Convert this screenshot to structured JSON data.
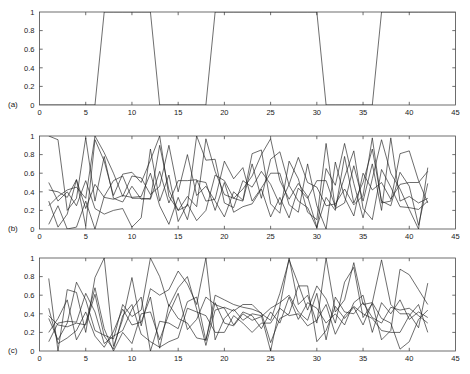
{
  "figure": {
    "background_color": "#ffffff",
    "line_color": "#1f1f1f",
    "axis_color": "#4a4a4a",
    "panel_tags": [
      "(a)",
      "(b)",
      "(c)"
    ]
  },
  "chart_data": [
    {
      "type": "line",
      "title": "",
      "panel_tag": "(a)",
      "xlabel": "",
      "ylabel": "",
      "xlim": [
        0,
        45
      ],
      "ylim": [
        0,
        1
      ],
      "xticks": [
        0,
        5,
        10,
        15,
        20,
        25,
        30,
        35,
        40,
        45
      ],
      "xticklabels": [
        "0",
        "5",
        "10",
        "15",
        "20",
        "25",
        "30",
        "35",
        "40",
        "45"
      ],
      "yticks": [
        0,
        0.2,
        0.4,
        0.6,
        0.8,
        1
      ],
      "yticklabels": [
        "0",
        "0.2",
        "0.4",
        "0.6",
        "0.8",
        "1"
      ],
      "grid": false,
      "legend": "none",
      "series": [
        {
          "name": "binary-regime-signal",
          "x": [
            0,
            1,
            2,
            3,
            4,
            5,
            6,
            7,
            8,
            9,
            10,
            11,
            12,
            13,
            14,
            15,
            16,
            17,
            18,
            19,
            20,
            21,
            22,
            23,
            24,
            25,
            26,
            27,
            28,
            29,
            30,
            31,
            32,
            33,
            34,
            35,
            36,
            37,
            38,
            39,
            40,
            41,
            42,
            43,
            44,
            45
          ],
          "values": [
            0,
            0,
            0,
            0,
            0,
            0,
            0,
            1,
            1,
            1,
            1,
            1,
            1,
            0,
            0,
            0,
            0,
            0,
            0,
            1,
            1,
            1,
            1,
            1,
            1,
            1,
            1,
            1,
            1,
            1,
            1,
            0,
            0,
            0,
            0,
            0,
            0,
            1,
            1,
            1,
            1,
            1,
            1,
            1,
            1,
            1
          ]
        }
      ]
    },
    {
      "type": "line",
      "title": "",
      "panel_tag": "(b)",
      "xlabel": "",
      "ylabel": "",
      "xlim": [
        0,
        45
      ],
      "ylim": [
        0,
        1
      ],
      "xticks": [
        0,
        5,
        10,
        15,
        20,
        25,
        30,
        35,
        40,
        45
      ],
      "xticklabels": [
        "0",
        "5",
        "10",
        "15",
        "20",
        "25",
        "30",
        "35",
        "40",
        "45"
      ],
      "yticks": [
        0,
        0.2,
        0.4,
        0.6,
        0.8,
        1
      ],
      "yticklabels": [
        "0",
        "0.2",
        "0.4",
        "0.6",
        "0.8",
        "1"
      ],
      "grid": false,
      "legend": "none",
      "x": [
        1,
        2,
        3,
        4,
        5,
        6,
        7,
        8,
        9,
        10,
        11,
        12,
        13,
        14,
        15,
        16,
        17,
        18,
        19,
        20,
        21,
        22,
        23,
        24,
        25,
        26,
        27,
        28,
        29,
        30,
        31,
        32,
        33,
        34,
        35,
        36,
        37,
        38,
        39,
        40,
        41,
        42
      ],
      "series": [
        {
          "name": "series-1",
          "values": [
            1.0,
            0.96,
            0.2,
            0.33,
            0.98,
            0.3,
            0.78,
            0.33,
            0.29,
            0.46,
            0.32,
            0.33,
            0.9,
            0.42,
            0.2,
            0.35,
            0.24,
            0.97,
            0.62,
            0.37,
            0.33,
            0.43,
            0.57,
            0.8,
            0.97,
            0.52,
            0.32,
            0.49,
            0.35,
            0.02,
            0.34,
            0.2,
            0.78,
            0.28,
            0.5,
            0.86,
            0.3,
            0.25,
            0.61,
            0.46,
            0.04,
            0.49
          ]
        },
        {
          "name": "series-2",
          "values": [
            0.3,
            0.02,
            0.16,
            0.53,
            0.03,
            0.96,
            0.73,
            0.36,
            0.59,
            0.61,
            0.5,
            0.74,
            1.0,
            0.35,
            0.2,
            0.25,
            1.0,
            0.74,
            0.75,
            0.28,
            0.23,
            0.52,
            0.45,
            0.62,
            0.48,
            0.26,
            0.48,
            0.77,
            0.5,
            0.45,
            0.25,
            0.27,
            0.43,
            0.26,
            0.36,
            0.98,
            0.28,
            0.3,
            0.81,
            0.84,
            0.52,
            0.28
          ]
        },
        {
          "name": "series-3",
          "values": [
            0.5,
            0.3,
            0.4,
            0.25,
            0.52,
            0.22,
            0.16,
            0.2,
            0.22,
            0.02,
            0.12,
            0.86,
            0.3,
            0.58,
            0.08,
            0.27,
            0.09,
            0.2,
            0.58,
            0.52,
            0.33,
            0.3,
            0.7,
            0.33,
            0.75,
            0.83,
            0.47,
            0.3,
            0.23,
            0.01,
            0.65,
            0.47,
            0.92,
            0.49,
            0.12,
            0.54,
            0.96,
            0.6,
            0.43,
            0.21,
            0.0,
            0.66
          ]
        },
        {
          "name": "series-4",
          "values": [
            0.25,
            0.35,
            0.42,
            0.45,
            0.33,
            1.0,
            0.82,
            0.6,
            0.35,
            0.57,
            0.55,
            0.37,
            0.46,
            0.9,
            0.4,
            0.8,
            0.36,
            0.46,
            0.3,
            0.13,
            0.4,
            0.31,
            0.81,
            0.85,
            0.27,
            0.17,
            0.73,
            0.54,
            0.18,
            0.1,
            0.92,
            0.22,
            0.28,
            0.68,
            0.3,
            0.7,
            0.2,
            0.98,
            0.3,
            0.35,
            0.28,
            0.33
          ]
        },
        {
          "name": "series-5",
          "values": [
            0.05,
            0.25,
            0.0,
            0.02,
            0.3,
            0.0,
            0.35,
            0.52,
            0.57,
            0.33,
            0.33,
            0.32,
            0.62,
            0.28,
            0.52,
            0.52,
            0.53,
            0.3,
            0.32,
            0.73,
            0.54,
            0.66,
            0.3,
            0.44,
            0.6,
            0.6,
            0.26,
            0.18,
            0.7,
            0.25,
            0.0,
            0.72,
            0.34,
            0.14,
            0.6,
            0.42,
            0.5,
            0.32,
            0.48,
            0.5,
            0.5,
            0.62
          ]
        },
        {
          "name": "series-6",
          "values": [
            0.42,
            0.4,
            0.34,
            0.53,
            0.22,
            0.48,
            0.34,
            0.32,
            0.36,
            0.34,
            0.35,
            0.6,
            0.25,
            0.05,
            0.34,
            0.1,
            0.52,
            0.5,
            0.2,
            0.5,
            0.18,
            0.24,
            0.27,
            0.43,
            0.13,
            0.34,
            0.12,
            0.44,
            0.33,
            0.52,
            0.52,
            0.24,
            0.56,
            0.84,
            0.22,
            0.1,
            0.64,
            0.45,
            0.24,
            0.23,
            0.21,
            0.3
          ]
        }
      ]
    },
    {
      "type": "line",
      "title": "",
      "panel_tag": "(c)",
      "xlabel": "",
      "ylabel": "",
      "xlim": [
        0,
        45
      ],
      "ylim": [
        0,
        1
      ],
      "xticks": [
        0,
        5,
        10,
        15,
        20,
        25,
        30,
        35,
        40,
        45
      ],
      "xticklabels": [
        "0",
        "5",
        "10",
        "15",
        "20",
        "25",
        "30",
        "35",
        "40",
        "45"
      ],
      "yticks": [
        0,
        0.2,
        0.4,
        0.6,
        0.8,
        1
      ],
      "yticklabels": [
        "0",
        "0.2",
        "0.4",
        "0.6",
        "0.8",
        "1"
      ],
      "grid": false,
      "legend": "none",
      "x": [
        1,
        2,
        3,
        4,
        5,
        6,
        7,
        8,
        9,
        10,
        11,
        12,
        13,
        14,
        15,
        16,
        17,
        18,
        19,
        20,
        21,
        22,
        23,
        24,
        25,
        26,
        27,
        28,
        29,
        30,
        31,
        32,
        33,
        34,
        35,
        36,
        37,
        38,
        39,
        40,
        41,
        42
      ],
      "series": [
        {
          "name": "series-1",
          "values": [
            0.78,
            0.0,
            0.66,
            0.63,
            0.2,
            0.79,
            1.0,
            0.05,
            0.34,
            0.79,
            0.27,
            0.67,
            0.6,
            0.66,
            0.86,
            0.72,
            0.5,
            1.0,
            0.12,
            0.35,
            0.45,
            0.33,
            0.4,
            0.38,
            0.0,
            0.48,
            1.0,
            0.5,
            0.6,
            0.3,
            1.0,
            0.42,
            0.55,
            0.95,
            0.5,
            0.52,
            0.98,
            0.5,
            0.4,
            0.4,
            0.25,
            0.73
          ]
        },
        {
          "name": "series-2",
          "values": [
            0.35,
            0.12,
            0.3,
            0.74,
            0.55,
            0.22,
            0.17,
            0.13,
            0.5,
            0.37,
            0.44,
            1.0,
            0.8,
            0.48,
            0.68,
            0.8,
            0.45,
            0.06,
            0.44,
            0.47,
            0.43,
            0.5,
            0.5,
            0.4,
            0.33,
            0.62,
            0.98,
            0.72,
            0.44,
            0.7,
            0.56,
            0.3,
            0.74,
            0.9,
            0.36,
            0.51,
            0.12,
            0.22,
            0.88,
            0.82,
            0.66,
            0.5
          ]
        },
        {
          "name": "series-3",
          "values": [
            0.1,
            0.3,
            0.32,
            0.31,
            0.62,
            0.42,
            0.08,
            0.16,
            0.22,
            0.45,
            0.58,
            0.0,
            0.32,
            0.3,
            0.24,
            0.53,
            0.58,
            0.11,
            0.6,
            0.55,
            0.5,
            0.47,
            0.45,
            0.41,
            0.09,
            0.35,
            0.4,
            0.7,
            0.7,
            0.1,
            0.22,
            0.48,
            0.35,
            0.47,
            0.28,
            0.52,
            0.35,
            0.3,
            0.02,
            0.1,
            0.34,
            0.44
          ]
        },
        {
          "name": "series-4",
          "values": [
            0.38,
            0.28,
            0.26,
            0.3,
            0.28,
            0.61,
            0.16,
            0.02,
            0.38,
            0.5,
            0.18,
            0.1,
            0.04,
            0.1,
            0.14,
            0.46,
            0.42,
            0.38,
            0.2,
            0.2,
            0.38,
            0.3,
            0.2,
            0.3,
            0.3,
            0.46,
            0.38,
            0.4,
            0.27,
            0.33,
            0.5,
            0.18,
            0.38,
            0.48,
            0.4,
            0.35,
            0.22,
            0.2,
            0.2,
            0.38,
            0.5,
            0.2
          ]
        },
        {
          "name": "series-5",
          "values": [
            0.46,
            0.08,
            0.14,
            0.22,
            0.42,
            0.16,
            0.04,
            0.21,
            0.45,
            0.28,
            0.31,
            0.58,
            0.03,
            0.5,
            0.35,
            0.3,
            0.14,
            0.12,
            0.52,
            0.3,
            0.27,
            0.4,
            0.33,
            0.37,
            0.46,
            0.52,
            0.6,
            0.42,
            0.33,
            0.62,
            0.12,
            0.58,
            0.42,
            0.4,
            0.52,
            0.36,
            0.3,
            0.47,
            0.44,
            0.46,
            0.38,
            0.3
          ]
        },
        {
          "name": "series-6",
          "values": [
            0.2,
            0.35,
            0.55,
            0.12,
            0.3,
            0.68,
            0.24,
            0.0,
            0.2,
            0.08,
            0.4,
            0.42,
            0.12,
            0.4,
            0.62,
            0.23,
            0.34,
            0.58,
            0.5,
            0.46,
            0.28,
            0.42,
            0.38,
            0.24,
            0.42,
            0.3,
            0.58,
            0.34,
            0.52,
            0.46,
            0.3,
            0.4,
            0.28,
            0.52,
            0.6,
            0.2,
            0.52,
            0.4,
            0.55,
            0.34,
            0.42,
            0.36
          ]
        }
      ]
    }
  ]
}
